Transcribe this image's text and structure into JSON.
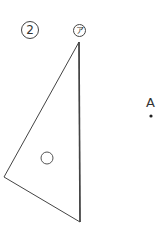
{
  "figure": {
    "number_label": "2",
    "vertex_label": "ア",
    "point_label": "A",
    "stroke_color": "#444444",
    "background_color": "#ffffff"
  }
}
